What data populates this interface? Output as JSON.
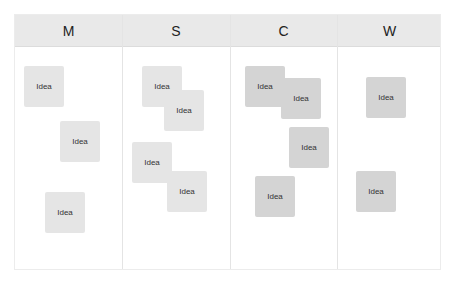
{
  "board": {
    "columns": [
      {
        "id": "m",
        "label": "M"
      },
      {
        "id": "s",
        "label": "S"
      },
      {
        "id": "c",
        "label": "C"
      },
      {
        "id": "w",
        "label": "W"
      }
    ],
    "colors": {
      "header_bg": "#e9e9e9",
      "note_light": "#e5e5e5",
      "note_dark": "#d4d4d4",
      "divider": "#e4e4e4"
    },
    "notes": [
      {
        "column": "M",
        "label": "Idea",
        "x": 24,
        "y": 66,
        "shade": "light"
      },
      {
        "column": "M",
        "label": "Idea",
        "x": 60,
        "y": 121,
        "shade": "light"
      },
      {
        "column": "M",
        "label": "Idea",
        "x": 45,
        "y": 192,
        "shade": "light"
      },
      {
        "column": "S",
        "label": "Idea",
        "x": 142,
        "y": 66,
        "shade": "light"
      },
      {
        "column": "S",
        "label": "Idea",
        "x": 164,
        "y": 90,
        "shade": "light"
      },
      {
        "column": "S",
        "label": "Idea",
        "x": 132,
        "y": 142,
        "shade": "light"
      },
      {
        "column": "S",
        "label": "Idea",
        "x": 167,
        "y": 171,
        "shade": "light"
      },
      {
        "column": "C",
        "label": "Idea",
        "x": 245,
        "y": 66,
        "shade": "dark"
      },
      {
        "column": "C",
        "label": "Idea",
        "x": 281,
        "y": 78,
        "shade": "dark"
      },
      {
        "column": "C",
        "label": "Idea",
        "x": 289,
        "y": 127,
        "shade": "dark"
      },
      {
        "column": "C",
        "label": "Idea",
        "x": 255,
        "y": 176,
        "shade": "dark"
      },
      {
        "column": "W",
        "label": "Idea",
        "x": 366,
        "y": 77,
        "shade": "dark"
      },
      {
        "column": "W",
        "label": "Idea",
        "x": 356,
        "y": 171,
        "shade": "dark"
      }
    ]
  }
}
